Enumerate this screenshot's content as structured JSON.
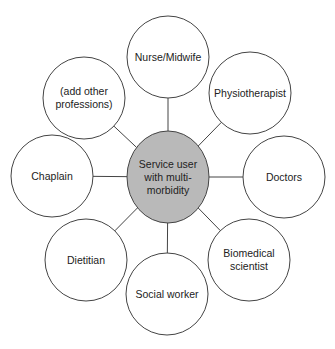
{
  "diagram": {
    "type": "hub-and-spoke",
    "colors": {
      "hub_fill": "#b9b9b9",
      "stroke": "#444444",
      "node_fill": "#ffffff"
    },
    "hub": {
      "label": "Service user\nwith multi-\nmorbidity",
      "cx": 168,
      "cy": 177,
      "rx": 41,
      "ry": 46
    },
    "nodes": [
      {
        "id": "nurse-midwife",
        "label": "Nurse/Midwife",
        "cx": 168,
        "cy": 57
      },
      {
        "id": "physiotherapist",
        "label": "Physiotherapist",
        "cx": 250,
        "cy": 93
      },
      {
        "id": "doctors",
        "label": "Doctors",
        "cx": 284,
        "cy": 177
      },
      {
        "id": "biomedical-scientist",
        "label": "Biomedical\nscientist",
        "cx": 249,
        "cy": 260
      },
      {
        "id": "social-worker",
        "label": "Social worker",
        "cx": 167,
        "cy": 294
      },
      {
        "id": "dietitian",
        "label": "Dietitian",
        "cx": 86,
        "cy": 260
      },
      {
        "id": "chaplain",
        "label": "Chaplain",
        "cx": 52,
        "cy": 176
      },
      {
        "id": "add-other-professions",
        "label": "(add other\nprofessions)",
        "cx": 84,
        "cy": 98
      }
    ],
    "node_radius": 41
  }
}
